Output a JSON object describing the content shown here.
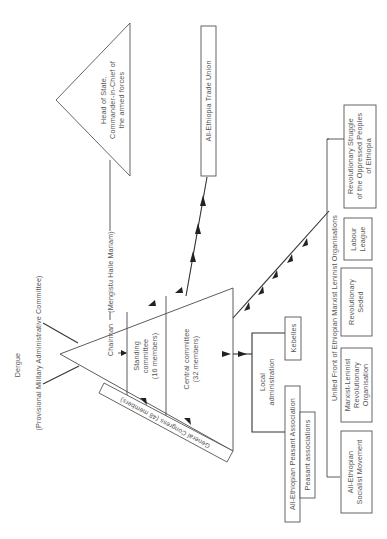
{
  "diagram": {
    "orientation": "rotated-90-ccw",
    "derg": {
      "title": "Dergue",
      "subtitle": "(Provisional Military Administrative Committee)"
    },
    "triangle": {
      "chairman": "Chairman",
      "chairman_name": "(Mengistu Haile Mariam)",
      "standing_committee": [
        "Standing",
        "committee",
        "(16 members)"
      ],
      "central_committee": [
        "Central committee",
        "(32 members)"
      ],
      "general_congress": "General Congress (48 members)"
    },
    "head_of_state": [
      "Head of State,",
      "Commander-in-Chief of",
      "the armed forces"
    ],
    "trade_union": "All-Ethiopia Trade Union",
    "local_admin": {
      "label": [
        "Local",
        "administration"
      ],
      "kebeles": "Kebelles",
      "peasant_association": "All-Ethiopian Peasant Association",
      "peasant_associations": "Peasant associations"
    },
    "united_front": {
      "label": "United Front of Ethiopian Marxist Leninist Organisations",
      "members": [
        {
          "lines": [
            "All-Ethiopian",
            "Socialist Movement"
          ]
        },
        {
          "lines": [
            "Marxist-Leninist",
            "Revolutionary",
            "Organisation"
          ]
        },
        {
          "lines": [
            "Revolutionary",
            "Seded"
          ]
        },
        {
          "lines": [
            "Labour",
            "League"
          ]
        },
        {
          "lines": [
            "Revolutionary Struggle",
            "of the Oppressed Peoples",
            "of Ethiopia"
          ]
        }
      ]
    }
  }
}
